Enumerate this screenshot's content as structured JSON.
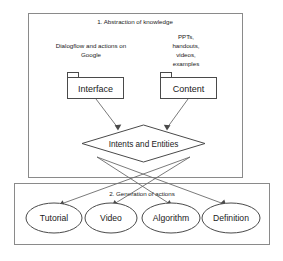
{
  "diagram": {
    "sections": [
      {
        "id": "abstraction",
        "title": "1. Abstraction of knowledge"
      },
      {
        "id": "generation",
        "title": "2. Generation of actions"
      }
    ],
    "annotations": [
      {
        "id": "interface-annotation",
        "lines": [
          "Dialogflow and actions on",
          "Google"
        ]
      },
      {
        "id": "content-annotation",
        "lines": [
          "PPTs,",
          "handouts,",
          "videos,",
          "examples"
        ]
      }
    ],
    "package_nodes": [
      {
        "id": "interface",
        "label": "Interface"
      },
      {
        "id": "content",
        "label": "Content"
      }
    ],
    "decision_node": {
      "id": "intents-and-entities",
      "label": "Intents and Entities"
    },
    "action_nodes": [
      {
        "id": "tutorial",
        "label": "Tutorial"
      },
      {
        "id": "video",
        "label": "Video"
      },
      {
        "id": "algorithm",
        "label": "Algorithm"
      },
      {
        "id": "definition",
        "label": "Definition"
      }
    ],
    "colors": {
      "background": "#ffffff",
      "group_border": "#8a8a8a",
      "node_border": "#4a4a4a",
      "edge": "#6b6b6b",
      "text": "#1a1a1a"
    }
  }
}
